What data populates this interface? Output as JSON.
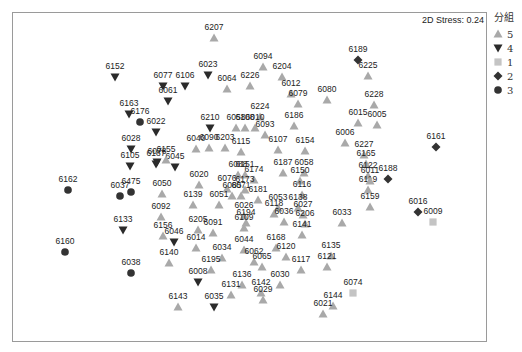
{
  "chart_data": {
    "type": "scatter",
    "title": "",
    "annotation": "2D Stress: 0.24",
    "xlabel": "",
    "ylabel": "",
    "grid": false,
    "legend_position": "right",
    "legend_title": "分組",
    "groups": [
      {
        "name": "5",
        "shape": "triangle-up",
        "color": "#a9a9a9"
      },
      {
        "name": "4",
        "shape": "triangle-down",
        "color": "#2b2b2b"
      },
      {
        "name": "1",
        "shape": "square",
        "color": "#c4c4c4"
      },
      {
        "name": "2",
        "shape": "diamond",
        "color": "#333333"
      },
      {
        "name": "3",
        "shape": "circle",
        "color": "#333333"
      }
    ],
    "points": [
      {
        "id": "6207",
        "g": "5",
        "x": 214,
        "y": 38
      },
      {
        "id": "6152",
        "g": "4",
        "x": 115,
        "y": 77
      },
      {
        "id": "6094",
        "g": "5",
        "x": 263,
        "y": 67
      },
      {
        "id": "6023",
        "g": "4",
        "x": 208,
        "y": 75
      },
      {
        "id": "6204",
        "g": "5",
        "x": 282,
        "y": 77
      },
      {
        "id": "6226",
        "g": "5",
        "x": 250,
        "y": 86
      },
      {
        "id": "6064",
        "g": "5",
        "x": 227,
        "y": 89
      },
      {
        "id": "6077",
        "g": "4",
        "x": 163,
        "y": 86
      },
      {
        "id": "6106",
        "g": "4",
        "x": 185,
        "y": 86
      },
      {
        "id": "6061",
        "g": "4",
        "x": 168,
        "y": 101
      },
      {
        "id": "6012",
        "g": "5",
        "x": 291,
        "y": 94
      },
      {
        "id": "6079",
        "g": "5",
        "x": 298,
        "y": 104
      },
      {
        "id": "6189",
        "g": "2",
        "x": 358,
        "y": 60
      },
      {
        "id": "6225",
        "g": "5",
        "x": 368,
        "y": 76
      },
      {
        "id": "6080",
        "g": "5",
        "x": 327,
        "y": 100
      },
      {
        "id": "6228",
        "g": "5",
        "x": 374,
        "y": 105
      },
      {
        "id": "6015",
        "g": "5",
        "x": 358,
        "y": 123
      },
      {
        "id": "6005",
        "g": "5",
        "x": 377,
        "y": 125
      },
      {
        "id": "6006",
        "g": "5",
        "x": 345,
        "y": 143
      },
      {
        "id": "6161",
        "g": "2",
        "x": 436,
        "y": 147
      },
      {
        "id": "6163",
        "g": "4",
        "x": 129,
        "y": 114
      },
      {
        "id": "6176",
        "g": "3",
        "x": 140,
        "y": 122
      },
      {
        "id": "6022",
        "g": "4",
        "x": 156,
        "y": 132
      },
      {
        "id": "6224",
        "g": "5",
        "x": 260,
        "y": 117
      },
      {
        "id": "6186",
        "g": "5",
        "x": 294,
        "y": 126
      },
      {
        "id": "6210",
        "g": "4",
        "x": 210,
        "y": 128
      },
      {
        "id": "6058a",
        "label": "6058",
        "g": "5",
        "x": 236,
        "y": 128
      },
      {
        "id": "6108",
        "g": "5",
        "x": 245,
        "y": 128
      },
      {
        "id": "6010",
        "g": "5",
        "x": 255,
        "y": 128
      },
      {
        "id": "6093",
        "g": "5",
        "x": 265,
        "y": 135
      },
      {
        "id": "6028",
        "g": "4",
        "x": 131,
        "y": 149
      },
      {
        "id": "6078",
        "g": "4",
        "x": 157,
        "y": 162
      },
      {
        "id": "6040",
        "g": "5",
        "x": 196,
        "y": 149
      },
      {
        "id": "6090",
        "g": "5",
        "x": 209,
        "y": 148
      },
      {
        "id": "6203",
        "g": "5",
        "x": 225,
        "y": 148
      },
      {
        "id": "6115",
        "g": "5",
        "x": 241,
        "y": 152
      },
      {
        "id": "6107",
        "g": "5",
        "x": 278,
        "y": 150
      },
      {
        "id": "6154",
        "g": "5",
        "x": 305,
        "y": 151
      },
      {
        "id": "6105",
        "g": "4",
        "x": 130,
        "y": 166
      },
      {
        "id": "6187a",
        "label": "6187",
        "g": "4",
        "x": 156,
        "y": 164
      },
      {
        "id": "6045",
        "g": "4",
        "x": 175,
        "y": 167
      },
      {
        "id": "6156a",
        "label": "6155",
        "g": "5",
        "x": 166,
        "y": 160
      },
      {
        "id": "6020",
        "g": "5",
        "x": 199,
        "y": 185
      },
      {
        "id": "6088",
        "g": "5",
        "x": 238,
        "y": 175
      },
      {
        "id": "6151",
        "g": "5",
        "x": 245,
        "y": 175
      },
      {
        "id": "6187",
        "g": "5",
        "x": 283,
        "y": 173
      },
      {
        "id": "6058",
        "g": "5",
        "x": 304,
        "y": 173
      },
      {
        "id": "6174",
        "g": "5",
        "x": 254,
        "y": 180
      },
      {
        "id": "6150",
        "g": "5",
        "x": 300,
        "y": 181
      },
      {
        "id": "6076",
        "g": "5",
        "x": 227,
        "y": 189
      },
      {
        "id": "6173",
        "g": "5",
        "x": 245,
        "y": 190
      },
      {
        "id": "6085",
        "g": "5",
        "x": 232,
        "y": 196
      },
      {
        "id": "6071",
        "g": "5",
        "x": 241,
        "y": 196
      },
      {
        "id": "6181",
        "g": "5",
        "x": 258,
        "y": 200
      },
      {
        "id": "6116",
        "g": "5",
        "x": 302,
        "y": 195
      },
      {
        "id": "6053",
        "g": "5",
        "x": 278,
        "y": 208
      },
      {
        "id": "6138",
        "g": "5",
        "x": 298,
        "y": 208
      },
      {
        "id": "6118",
        "g": "5",
        "x": 274,
        "y": 214
      },
      {
        "id": "6027",
        "g": "5",
        "x": 303,
        "y": 215
      },
      {
        "id": "6036",
        "g": "5",
        "x": 284,
        "y": 222
      },
      {
        "id": "6206",
        "g": "5",
        "x": 305,
        "y": 224
      },
      {
        "id": "6141",
        "g": "5",
        "x": 302,
        "y": 235
      },
      {
        "id": "6227",
        "g": "5",
        "x": 364,
        "y": 155
      },
      {
        "id": "6165",
        "g": "5",
        "x": 366,
        "y": 164
      },
      {
        "id": "6122",
        "g": "5",
        "x": 368,
        "y": 176
      },
      {
        "id": "6119",
        "g": "5",
        "x": 368,
        "y": 190
      },
      {
        "id": "6159",
        "g": "5",
        "x": 370,
        "y": 207
      },
      {
        "id": "6011",
        "g": "5",
        "x": 370,
        "y": 181
      },
      {
        "id": "6188",
        "g": "2",
        "x": 388,
        "y": 179
      },
      {
        "id": "6016",
        "g": "2",
        "x": 418,
        "y": 212
      },
      {
        "id": "6009",
        "g": "1",
        "x": 433,
        "y": 222
      },
      {
        "id": "6033",
        "g": "5",
        "x": 342,
        "y": 223
      },
      {
        "id": "6162",
        "g": "3",
        "x": 68,
        "y": 190
      },
      {
        "id": "6037",
        "g": "3",
        "x": 120,
        "y": 196
      },
      {
        "id": "6475",
        "g": "3",
        "x": 131,
        "y": 192
      },
      {
        "id": "6050",
        "g": "5",
        "x": 162,
        "y": 194
      },
      {
        "id": "6139",
        "g": "5",
        "x": 193,
        "y": 205
      },
      {
        "id": "6051",
        "g": "5",
        "x": 219,
        "y": 205
      },
      {
        "id": "6092",
        "g": "5",
        "x": 161,
        "y": 217
      },
      {
        "id": "6026",
        "g": "5",
        "x": 244,
        "y": 216
      },
      {
        "id": "6194",
        "g": "5",
        "x": 246,
        "y": 223
      },
      {
        "id": "6109",
        "g": "5",
        "x": 244,
        "y": 228
      },
      {
        "id": "6205",
        "g": "5",
        "x": 198,
        "y": 230
      },
      {
        "id": "6091",
        "g": "5",
        "x": 213,
        "y": 233
      },
      {
        "id": "6133",
        "g": "4",
        "x": 123,
        "y": 230
      },
      {
        "id": "6156",
        "g": "5",
        "x": 163,
        "y": 236
      },
      {
        "id": "6046",
        "g": "4",
        "x": 174,
        "y": 242
      },
      {
        "id": "6014",
        "g": "5",
        "x": 196,
        "y": 248
      },
      {
        "id": "6044",
        "g": "5",
        "x": 244,
        "y": 250
      },
      {
        "id": "6168",
        "g": "5",
        "x": 276,
        "y": 248
      },
      {
        "id": "6120",
        "g": "5",
        "x": 286,
        "y": 257
      },
      {
        "id": "6135",
        "g": "5",
        "x": 331,
        "y": 256
      },
      {
        "id": "6160",
        "g": "3",
        "x": 65,
        "y": 252
      },
      {
        "id": "6140",
        "g": "5",
        "x": 169,
        "y": 263
      },
      {
        "id": "6034",
        "g": "5",
        "x": 222,
        "y": 258
      },
      {
        "id": "6062",
        "g": "5",
        "x": 254,
        "y": 262
      },
      {
        "id": "6065",
        "g": "5",
        "x": 262,
        "y": 267
      },
      {
        "id": "6121",
        "g": "5",
        "x": 327,
        "y": 267
      },
      {
        "id": "6117",
        "g": "5",
        "x": 301,
        "y": 270
      },
      {
        "id": "6195",
        "g": "5",
        "x": 211,
        "y": 270
      },
      {
        "id": "6038",
        "g": "3",
        "x": 131,
        "y": 273
      },
      {
        "id": "6008",
        "g": "4",
        "x": 198,
        "y": 282
      },
      {
        "id": "6136",
        "g": "5",
        "x": 242,
        "y": 285
      },
      {
        "id": "6030",
        "g": "5",
        "x": 280,
        "y": 285
      },
      {
        "id": "6142",
        "g": "5",
        "x": 261,
        "y": 293
      },
      {
        "id": "6131",
        "g": "5",
        "x": 231,
        "y": 295
      },
      {
        "id": "6029",
        "g": "5",
        "x": 263,
        "y": 300
      },
      {
        "id": "6074",
        "g": "1",
        "x": 353,
        "y": 293
      },
      {
        "id": "6143",
        "g": "5",
        "x": 178,
        "y": 307
      },
      {
        "id": "6035",
        "g": "4",
        "x": 214,
        "y": 307
      },
      {
        "id": "6144",
        "g": "5",
        "x": 333,
        "y": 306
      },
      {
        "id": "6021",
        "g": "5",
        "x": 323,
        "y": 314
      }
    ]
  }
}
